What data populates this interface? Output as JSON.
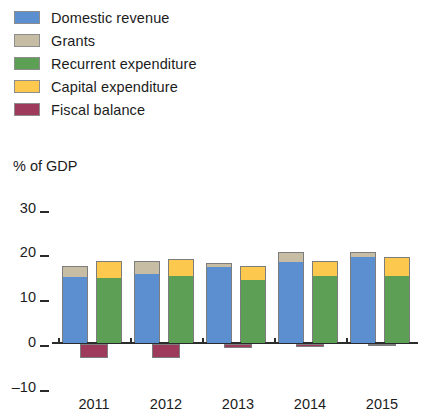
{
  "legend": {
    "items": [
      {
        "label": "Domestic revenue",
        "color": "#5b8fd0",
        "key": "domestic_revenue"
      },
      {
        "label": "Grants",
        "color": "#c7bda4",
        "key": "grants"
      },
      {
        "label": "Recurrent expenditure",
        "color": "#5da055",
        "key": "recurrent_expenditure"
      },
      {
        "label": "Capital expenditure",
        "color": "#fcc94e",
        "key": "capital_expenditure"
      },
      {
        "label": "Fiscal balance",
        "color": "#9e3a5c",
        "key": "fiscal_balance"
      }
    ]
  },
  "axis": {
    "y_title": "% of GDP",
    "y_ticks": [
      "30",
      "20",
      "10",
      "0",
      "–10"
    ],
    "x_ticks": [
      "2011",
      "2012",
      "2013",
      "2014",
      "2015"
    ]
  },
  "chart_data": {
    "type": "bar",
    "title": "",
    "subtitle": "",
    "xlabel": "",
    "ylabel": "% of GDP",
    "ylim": [
      -10,
      30
    ],
    "yticks": [
      -10,
      0,
      10,
      20,
      30
    ],
    "grid": false,
    "legend_position": "top-left",
    "categories": [
      "2011",
      "2012",
      "2013",
      "2014",
      "2015"
    ],
    "stacks": [
      {
        "name": "Revenue",
        "segments": [
          {
            "name": "Domestic revenue",
            "color": "#5b8fd0",
            "values": [
              14.8,
              15.5,
              17.0,
              18.0,
              19.2
            ]
          },
          {
            "name": "Grants",
            "color": "#c7bda4",
            "values": [
              2.2,
              2.5,
              0.6,
              2.0,
              1.0
            ]
          }
        ]
      },
      {
        "name": "Expenditure",
        "segments": [
          {
            "name": "Recurrent expenditure",
            "color": "#5da055",
            "values": [
              14.5,
              15.0,
              14.0,
              15.0,
              15.0
            ]
          },
          {
            "name": "Capital expenditure",
            "color": "#fcc94e",
            "values": [
              3.5,
              3.5,
              3.0,
              3.0,
              4.0
            ]
          }
        ]
      }
    ],
    "series": [
      {
        "name": "Domestic revenue",
        "color": "#5b8fd0",
        "values": [
          14.8,
          15.5,
          17.0,
          18.0,
          19.2
        ]
      },
      {
        "name": "Grants",
        "color": "#c7bda4",
        "values": [
          2.2,
          2.5,
          0.6,
          2.0,
          1.0
        ]
      },
      {
        "name": "Recurrent expenditure",
        "color": "#5da055",
        "values": [
          14.5,
          15.0,
          14.0,
          15.0,
          15.0
        ]
      },
      {
        "name": "Capital expenditure",
        "color": "#fcc94e",
        "values": [
          3.5,
          3.5,
          3.0,
          3.0,
          4.0
        ]
      },
      {
        "name": "Fiscal balance",
        "color": "#9e3a5c",
        "values": [
          -3.1,
          -3.2,
          -0.9,
          -0.7,
          -0.2
        ]
      }
    ],
    "totals": {
      "revenue": [
        17.0,
        18.0,
        17.6,
        20.0,
        20.2
      ],
      "expenditure": [
        18.0,
        18.5,
        17.0,
        18.0,
        19.0
      ]
    }
  }
}
